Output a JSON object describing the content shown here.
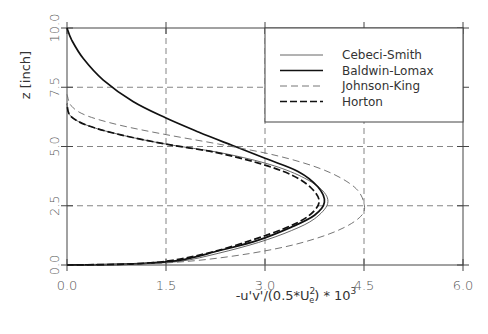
{
  "chart_data": {
    "type": "line",
    "title": "",
    "xlabel": "-u'v'/(0.5*U_e^2) * 10^3",
    "xlabel_parts": {
      "main": "-u'v'/(0.5*U",
      "sup": "2",
      "sub": "e",
      "tail": ") * 10",
      "exp": "3"
    },
    "ylabel": "z [inch]",
    "xlim": [
      0.0,
      6.0
    ],
    "ylim": [
      0.0,
      10.0
    ],
    "xticks": [
      "0.0",
      "1.5",
      "3.0",
      "4.5",
      "6.0"
    ],
    "yticks": [
      "0.0",
      "2.5",
      "5.0",
      "7.5",
      "10.0"
    ],
    "grid": "dashed at interior ticks",
    "legend_position": "upper right",
    "series": [
      {
        "name": "Cebeci-Smith",
        "style": "thin-solid",
        "points": [
          [
            0.0,
            0.0
          ],
          [
            1.0,
            0.05
          ],
          [
            1.7,
            0.15
          ],
          [
            2.3,
            0.5
          ],
          [
            2.9,
            0.95
          ],
          [
            3.4,
            1.45
          ],
          [
            3.75,
            1.95
          ],
          [
            3.95,
            2.6
          ],
          [
            3.85,
            3.2
          ],
          [
            3.5,
            3.8
          ],
          [
            3.0,
            4.3
          ],
          [
            2.3,
            4.75
          ],
          [
            1.5,
            5.1
          ],
          [
            0.8,
            5.5
          ],
          [
            0.3,
            5.9
          ],
          [
            0.05,
            6.3
          ],
          [
            0.0,
            6.8
          ]
        ]
      },
      {
        "name": "Baldwin-Lomax",
        "style": "thick-solid",
        "points": [
          [
            0.0,
            0.0
          ],
          [
            1.0,
            0.05
          ],
          [
            1.7,
            0.2
          ],
          [
            2.3,
            0.6
          ],
          [
            2.9,
            1.05
          ],
          [
            3.4,
            1.6
          ],
          [
            3.75,
            2.1
          ],
          [
            3.9,
            2.65
          ],
          [
            3.8,
            3.3
          ],
          [
            3.5,
            3.95
          ],
          [
            3.0,
            4.5
          ],
          [
            2.5,
            5.05
          ],
          [
            2.0,
            5.6
          ],
          [
            1.5,
            6.2
          ],
          [
            1.0,
            6.9
          ],
          [
            0.55,
            7.8
          ],
          [
            0.25,
            8.7
          ],
          [
            0.07,
            9.5
          ],
          [
            0.0,
            10.0
          ]
        ]
      },
      {
        "name": "Johnson-King",
        "style": "thin-dashed",
        "points": [
          [
            0.0,
            0.0
          ],
          [
            1.2,
            0.05
          ],
          [
            2.0,
            0.2
          ],
          [
            2.8,
            0.5
          ],
          [
            3.5,
            0.9
          ],
          [
            4.1,
            1.45
          ],
          [
            4.45,
            2.05
          ],
          [
            4.5,
            2.6
          ],
          [
            4.35,
            3.3
          ],
          [
            3.9,
            4.0
          ],
          [
            3.2,
            4.6
          ],
          [
            2.3,
            5.1
          ],
          [
            1.5,
            5.5
          ],
          [
            0.8,
            5.9
          ],
          [
            0.3,
            6.3
          ],
          [
            0.07,
            6.7
          ],
          [
            0.0,
            7.2
          ]
        ]
      },
      {
        "name": "Horton",
        "style": "thick-dashed",
        "points": [
          [
            0.0,
            0.0
          ],
          [
            1.0,
            0.05
          ],
          [
            1.6,
            0.2
          ],
          [
            2.2,
            0.55
          ],
          [
            2.8,
            1.05
          ],
          [
            3.3,
            1.55
          ],
          [
            3.65,
            2.05
          ],
          [
            3.82,
            2.65
          ],
          [
            3.7,
            3.25
          ],
          [
            3.4,
            3.8
          ],
          [
            2.9,
            4.3
          ],
          [
            2.25,
            4.75
          ],
          [
            1.5,
            5.1
          ],
          [
            0.8,
            5.5
          ],
          [
            0.3,
            5.9
          ],
          [
            0.05,
            6.3
          ],
          [
            0.0,
            6.8
          ]
        ]
      }
    ]
  }
}
